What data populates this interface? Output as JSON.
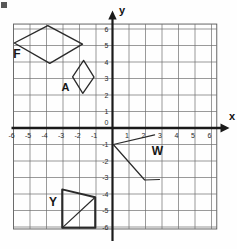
{
  "figure": {
    "axes": {
      "x_label": "x",
      "y_label": "y",
      "x_ticks": [
        -6,
        -5,
        -4,
        -3,
        -2,
        -1,
        1,
        2,
        3,
        4,
        5,
        6
      ],
      "y_ticks": [
        6,
        5,
        4,
        3,
        2,
        1,
        0,
        -1,
        -2,
        -3,
        -4,
        -5,
        -6
      ],
      "x_range": [
        -6,
        6
      ],
      "y_range": [
        -6,
        6
      ],
      "grid": true
    },
    "border": {
      "x0": -6.0,
      "x1": 6.32,
      "y0": -6.12,
      "y1": 6.3
    },
    "shapes": [
      {
        "label": "F",
        "type": "polygon",
        "closed": true,
        "vertices": [
          [
            -5.95,
            5.15
          ],
          [
            -3.92,
            6.2
          ],
          [
            -1.82,
            5.08
          ],
          [
            -3.8,
            3.92
          ]
        ],
        "label_pos": [
          -5.8,
          4.25
        ],
        "label_size": 12,
        "stroke_width": 1.4
      },
      {
        "label": "A",
        "type": "polygon",
        "closed": true,
        "vertices": [
          [
            -1.75,
            4.1
          ],
          [
            -1.12,
            3.08
          ],
          [
            -1.8,
            2.1
          ],
          [
            -2.42,
            3.1
          ]
        ],
        "label_pos": [
          -2.85,
          2.25
        ],
        "label_size": 11,
        "stroke_width": 1.3
      },
      {
        "label": "W",
        "type": "polyline",
        "closed": false,
        "vertices": [
          [
            2.55,
            -0.42
          ],
          [
            0.05,
            -1.0
          ],
          [
            1.95,
            -3.15
          ],
          [
            2.85,
            -3.12
          ]
        ],
        "label_pos": [
          2.72,
          -1.62
        ],
        "label_size": 12,
        "stroke_width": 1.2
      },
      {
        "label": "Y",
        "type": "polygon",
        "closed": true,
        "vertices": [
          [
            -3.05,
            -3.72
          ],
          [
            -1.05,
            -4.2
          ],
          [
            -1.05,
            -6.05
          ],
          [
            -3.05,
            -6.05
          ]
        ],
        "extra_segments": [
          [
            [
              -3.05,
              -6.05
            ],
            [
              -1.05,
              -4.2
            ]
          ]
        ],
        "label_pos": [
          -3.6,
          -4.72
        ],
        "label_size": 12,
        "stroke_width": 2.0,
        "extra_stroke_width": 1.2
      }
    ],
    "colors": {
      "grid_line": "#6e6e6e",
      "border_line": "#555555",
      "axis_line": "#1a1a1a",
      "shape_stroke": "#2a2a2a",
      "background": "#fefefe"
    },
    "artifacts": [
      {
        "name": "scan-mark-top-left",
        "x_px": 1,
        "y_px": 2,
        "w_px": 6,
        "h_px": 6
      }
    ]
  }
}
